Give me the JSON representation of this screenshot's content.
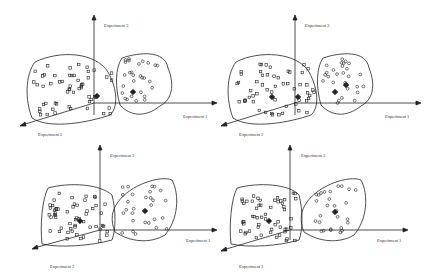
{
  "axes": {
    "x_label": "Experiment 1",
    "y_label": "Experiment 3",
    "z_label": "Experiment 2"
  },
  "panels": [
    {
      "id": "top-left",
      "description": "Initial single centroid in left cluster, single in right"
    },
    {
      "id": "top-right",
      "description": "Two centroids per cluster"
    },
    {
      "id": "bottom-left",
      "description": "Reassignment with grey boundary points"
    },
    {
      "id": "bottom-right",
      "description": "Converged centroids"
    }
  ],
  "colors": {
    "stroke": "#222222",
    "grey_point": "#999999"
  }
}
